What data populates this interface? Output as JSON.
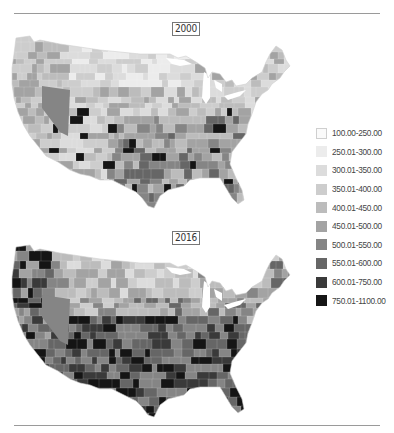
{
  "maps": [
    {
      "year_label": "2000"
    },
    {
      "year_label": "2016"
    }
  ],
  "legend": {
    "items": [
      {
        "label": "100.00-250.00",
        "color": "#fafafa",
        "border": "#cfcfcf"
      },
      {
        "label": "250.01-300.00",
        "color": "#ececec",
        "border": "#ececec"
      },
      {
        "label": "300.01-350.00",
        "color": "#dcdcdc",
        "border": "#dcdcdc"
      },
      {
        "label": "350.01-400.00",
        "color": "#cdcdcd",
        "border": "#cdcdcd"
      },
      {
        "label": "400.01-450.00",
        "color": "#bcbcbc",
        "border": "#bcbcbc"
      },
      {
        "label": "450.01-500.00",
        "color": "#a3a3a3",
        "border": "#a3a3a3"
      },
      {
        "label": "500.01-550.00",
        "color": "#858585",
        "border": "#858585"
      },
      {
        "label": "550.01-600.00",
        "color": "#666666",
        "border": "#666666"
      },
      {
        "label": "600.01-750.00",
        "color": "#3a3a3a",
        "border": "#3a3a3a"
      },
      {
        "label": "750.01-1100.00",
        "color": "#151515",
        "border": "#151515"
      }
    ]
  }
}
